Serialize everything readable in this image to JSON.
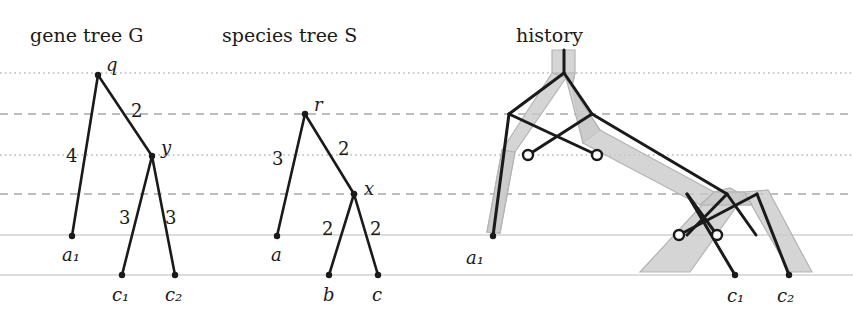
{
  "figure": {
    "width": 853,
    "height": 321,
    "background": "#ffffff",
    "ink_color": "#1a1a1a",
    "tube_fill": "#c9c9c9"
  },
  "panels": [
    {
      "id": "gene-tree",
      "title": "gene tree G",
      "title_x": 30,
      "title_y": 42
    },
    {
      "id": "species-tree",
      "title": "species tree S",
      "title_x": 222,
      "title_y": 42
    },
    {
      "id": "history",
      "title": "history",
      "title_x": 516,
      "title_y": 42
    }
  ],
  "time_lines": [
    {
      "name": "t-dotted-1",
      "y": 73,
      "style": "dotted",
      "color": "#b9b9b9"
    },
    {
      "name": "t-dashed-1",
      "y": 114,
      "style": "dashed",
      "color": "#a8a8a8"
    },
    {
      "name": "t-dotted-2",
      "y": 155,
      "style": "dotted",
      "color": "#b9b9b9"
    },
    {
      "name": "t-dashed-2",
      "y": 194,
      "style": "dashed",
      "color": "#a8a8a8"
    },
    {
      "name": "t-solid-1",
      "y": 235,
      "style": "solid",
      "color": "#d2d2d2"
    },
    {
      "name": "t-solid-2",
      "y": 275,
      "style": "solid",
      "color": "#d2d2d2"
    }
  ],
  "gene_tree": {
    "name": "G",
    "nodes": [
      {
        "id": "q",
        "label": "q",
        "x": 98,
        "y": 75,
        "kind": "internal",
        "label_dx": 8,
        "label_dy": -4
      },
      {
        "id": "y",
        "label": "y",
        "x": 152,
        "y": 156,
        "kind": "internal",
        "label_dx": 9,
        "label_dy": -2
      },
      {
        "id": "a1",
        "label": "a₁",
        "x": 72,
        "y": 236,
        "kind": "leaf",
        "label_dx": -10,
        "label_dy": 25
      },
      {
        "id": "c1",
        "label": "c₁",
        "x": 122,
        "y": 275,
        "kind": "leaf",
        "label_dx": -10,
        "label_dy": 26
      },
      {
        "id": "c2",
        "label": "c₂",
        "x": 175,
        "y": 275,
        "kind": "leaf",
        "label_dx": -10,
        "label_dy": 26
      }
    ],
    "edges": [
      {
        "from": "q",
        "to": "a1",
        "label": "4",
        "label_x": 66,
        "label_y": 162
      },
      {
        "from": "q",
        "to": "y",
        "label": "2",
        "label_x": 131,
        "label_y": 117
      },
      {
        "from": "y",
        "to": "c1",
        "label": "3",
        "label_x": 119,
        "label_y": 224
      },
      {
        "from": "y",
        "to": "c2",
        "label": "3",
        "label_x": 165,
        "label_y": 224
      }
    ]
  },
  "species_tree": {
    "name": "S",
    "nodes": [
      {
        "id": "r",
        "label": "r",
        "x": 305,
        "y": 114,
        "kind": "internal",
        "label_dx": 9,
        "label_dy": -3
      },
      {
        "id": "x",
        "label": "x",
        "x": 354,
        "y": 194,
        "kind": "internal",
        "label_dx": 10,
        "label_dy": 1
      },
      {
        "id": "a",
        "label": "a",
        "x": 277,
        "y": 236,
        "kind": "leaf",
        "label_dx": -6,
        "label_dy": 25
      },
      {
        "id": "b",
        "label": "b",
        "x": 329,
        "y": 275,
        "kind": "leaf",
        "label_dx": -6,
        "label_dy": 26
      },
      {
        "id": "c",
        "label": "c",
        "x": 378,
        "y": 275,
        "kind": "leaf",
        "label_dx": -6,
        "label_dy": 26
      }
    ],
    "edges": [
      {
        "from": "r",
        "to": "a",
        "label": "3",
        "label_x": 272,
        "label_y": 165
      },
      {
        "from": "r",
        "to": "x",
        "label": "2",
        "label_x": 338,
        "label_y": 155
      },
      {
        "from": "x",
        "to": "b",
        "label": "2",
        "label_x": 322,
        "label_y": 235
      },
      {
        "from": "x",
        "to": "c",
        "label": "2",
        "label_x": 370,
        "label_y": 235
      }
    ]
  },
  "history": {
    "leaf_labels": [
      {
        "id": "a1",
        "label": "a₁",
        "x": 466,
        "y": 264
      },
      {
        "id": "c1",
        "label": "c₁",
        "x": 727,
        "y": 302
      },
      {
        "id": "c2",
        "label": "c₂",
        "x": 777,
        "y": 302
      }
    ],
    "transfer_dots": [
      {
        "id": "transfer-1",
        "x": 528,
        "y": 155,
        "r": 5
      },
      {
        "id": "transfer-2",
        "x": 597,
        "y": 155,
        "r": 5
      },
      {
        "id": "transfer-3",
        "x": 679,
        "y": 235,
        "r": 5
      },
      {
        "id": "transfer-4",
        "x": 717,
        "y": 235,
        "r": 5
      }
    ],
    "species_tubes": [
      {
        "id": "tube-root",
        "desc": "root stem then split"
      },
      {
        "id": "tube-a",
        "desc": "left branch to a1"
      },
      {
        "id": "tube-rx",
        "desc": "right branch down to x"
      },
      {
        "id": "tube-b",
        "desc": "branch to b, gene lost"
      },
      {
        "id": "tube-c",
        "desc": "branch to c"
      }
    ]
  }
}
